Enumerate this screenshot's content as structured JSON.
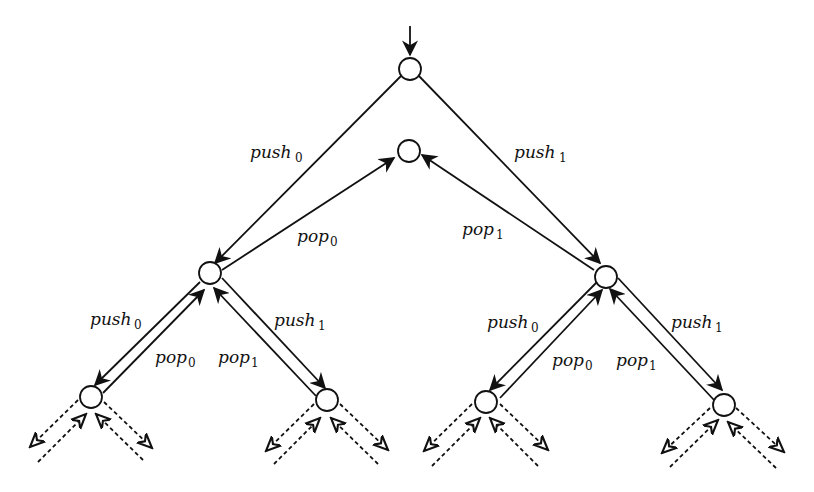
{
  "diagram": {
    "nodes": [
      {
        "id": "start"
      },
      {
        "id": "empty"
      },
      {
        "id": "s0"
      },
      {
        "id": "s1"
      },
      {
        "id": "s00"
      },
      {
        "id": "s01"
      },
      {
        "id": "s10"
      },
      {
        "id": "s11"
      }
    ],
    "edges": [
      {
        "from": "start",
        "to": "s0",
        "label": "push",
        "sub": "0"
      },
      {
        "from": "start",
        "to": "s1",
        "label": "push",
        "sub": "1"
      },
      {
        "from": "s0",
        "to": "empty",
        "label": "pop",
        "sub": "0"
      },
      {
        "from": "s1",
        "to": "empty",
        "label": "pop",
        "sub": "1"
      },
      {
        "from": "s0",
        "to": "s00",
        "label": "push",
        "sub": "0"
      },
      {
        "from": "s00",
        "to": "s0",
        "label": "pop",
        "sub": "0"
      },
      {
        "from": "s0",
        "to": "s01",
        "label": "push",
        "sub": "1"
      },
      {
        "from": "s01",
        "to": "s0",
        "label": "pop",
        "sub": "1"
      },
      {
        "from": "s1",
        "to": "s10",
        "label": "push",
        "sub": "0"
      },
      {
        "from": "s10",
        "to": "s1",
        "label": "pop",
        "sub": "0"
      },
      {
        "from": "s1",
        "to": "s11",
        "label": "push",
        "sub": "1"
      },
      {
        "from": "s11",
        "to": "s1",
        "label": "pop",
        "sub": "1"
      }
    ],
    "labels": {
      "push0": "push",
      "push1": "push",
      "pop0": "pop",
      "pop1": "pop",
      "sub0": "0",
      "sub1": "1"
    }
  }
}
